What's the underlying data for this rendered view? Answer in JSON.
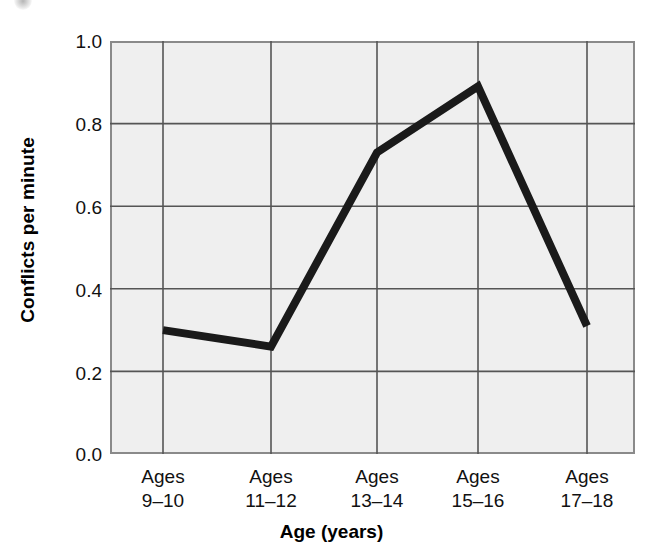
{
  "chart_data": {
    "type": "line",
    "title": "",
    "xlabel": "Age (years)",
    "ylabel": "Conflicts per minute",
    "categories": [
      "Ages 9–10",
      "Ages 11–12",
      "Ages 13–14",
      "Ages 15–16",
      "Ages 17–18"
    ],
    "category_lines": [
      {
        "line1": "Ages",
        "line2": "9–10"
      },
      {
        "line1": "Ages",
        "line2": "11–12"
      },
      {
        "line1": "Ages",
        "line2": "13–14"
      },
      {
        "line1": "Ages",
        "line2": "15–16"
      },
      {
        "line1": "Ages",
        "line2": "17–18"
      }
    ],
    "values": [
      0.3,
      0.26,
      0.73,
      0.89,
      0.31
    ],
    "ylim": [
      0.0,
      1.0
    ],
    "ytick_labels": [
      "1.0",
      "0.8",
      "0.6",
      "0.4",
      "0.2",
      "0.0"
    ],
    "ytick_values": [
      1.0,
      0.8,
      0.6,
      0.4,
      0.2,
      0.0
    ],
    "grid": true,
    "legend": "none",
    "series_color": "#1a1a1a",
    "plot_background": "#efefef",
    "grid_color": "#555555",
    "axis_color": "#8a8a8a"
  }
}
